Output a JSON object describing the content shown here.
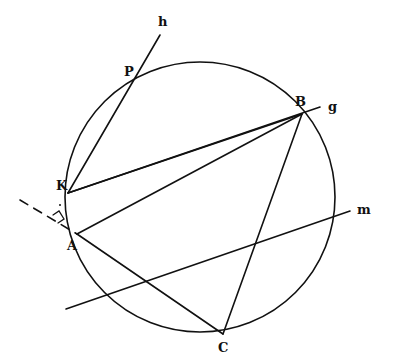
{
  "figure": {
    "type": "geometry-construction",
    "top_fragment": "",
    "stroke_color": "#111111",
    "background": "#ffffff",
    "circle": {
      "cx": 200,
      "cy": 197,
      "r": 135
    },
    "points": {
      "P": {
        "label": "P",
        "x": 136,
        "y": 79,
        "lx": 124,
        "ly": 76
      },
      "K": {
        "label": "K",
        "x": 68,
        "y": 193,
        "lx": 56,
        "ly": 190
      },
      "A": {
        "label": "A",
        "x": 77,
        "y": 234,
        "lx": 67,
        "ly": 250
      },
      "B": {
        "label": "B",
        "x": 302,
        "y": 114,
        "lx": 295,
        "ly": 106
      },
      "C": {
        "label": "C",
        "x": 223,
        "y": 334,
        "lx": 218,
        "ly": 352
      }
    },
    "lines": {
      "h": {
        "label": "h",
        "x1": 68,
        "y1": 193,
        "x2": 160,
        "y2": 35,
        "lx": 158,
        "ly": 26
      },
      "g": {
        "label": "g",
        "x1": 68,
        "y1": 193,
        "x2": 320,
        "y2": 107,
        "lx": 328,
        "ly": 111
      },
      "m": {
        "label": "m",
        "x1": 66,
        "y1": 309,
        "x2": 350,
        "y2": 211,
        "lx": 357,
        "ly": 214
      }
    },
    "segments": [
      {
        "name": "segment-KB",
        "x1": 68,
        "y1": 193,
        "x2": 302,
        "y2": 114
      },
      {
        "name": "segment-AB",
        "x1": 77,
        "y1": 234,
        "x2": 302,
        "y2": 114
      },
      {
        "name": "segment-AC",
        "x1": 77,
        "y1": 234,
        "x2": 223,
        "y2": 334
      },
      {
        "name": "segment-BC",
        "x1": 302,
        "y1": 114,
        "x2": 223,
        "y2": 334
      }
    ],
    "dashed_line": {
      "x1": 20,
      "y1": 200,
      "x2": 77,
      "y2": 234
    },
    "right_angle_mark": {
      "at": "foot of perpendicular from K",
      "x": 58,
      "y": 222
    }
  }
}
